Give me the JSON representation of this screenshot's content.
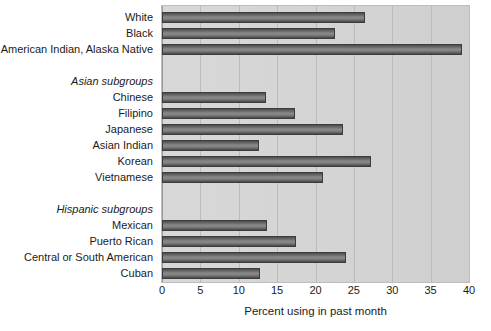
{
  "chart_data": {
    "type": "bar",
    "orientation": "horizontal",
    "title": "",
    "xlabel": "Percent using in past month",
    "ylabel": "",
    "xlim": [
      0,
      40
    ],
    "xticks": [
      0,
      5,
      10,
      15,
      20,
      25,
      30,
      35,
      40
    ],
    "xtick_labels": [
      "0",
      "5",
      "10",
      "15",
      "20",
      "25",
      "30",
      "35",
      "40"
    ],
    "grid": true,
    "grid_axis": "x",
    "legend": "none",
    "bar_color": "#7a7a7a",
    "bar_edge_color": "#3c3c3c",
    "plot_background": "#d4d4d4",
    "rows": [
      {
        "label": "White",
        "value": 26.5,
        "kind": "bar"
      },
      {
        "label": "Black",
        "value": 22.5,
        "kind": "bar"
      },
      {
        "label": "American Indian, Alaska Native",
        "value": 39.1,
        "kind": "bar"
      },
      {
        "label": "",
        "value": null,
        "kind": "spacer"
      },
      {
        "label": "Asian subgroups",
        "value": null,
        "kind": "group"
      },
      {
        "label": "Chinese",
        "value": 13.5,
        "kind": "bar"
      },
      {
        "label": "Filipino",
        "value": 17.3,
        "kind": "bar"
      },
      {
        "label": "Japanese",
        "value": 23.6,
        "kind": "bar"
      },
      {
        "label": "Asian Indian",
        "value": 12.6,
        "kind": "bar"
      },
      {
        "label": "Korean",
        "value": 27.2,
        "kind": "bar"
      },
      {
        "label": "Vietnamese",
        "value": 21.0,
        "kind": "bar"
      },
      {
        "label": "",
        "value": null,
        "kind": "spacer"
      },
      {
        "label": "Hispanic subgroups",
        "value": null,
        "kind": "group"
      },
      {
        "label": "Mexican",
        "value": 13.7,
        "kind": "bar"
      },
      {
        "label": "Puerto Rican",
        "value": 17.5,
        "kind": "bar"
      },
      {
        "label": "Central or South American",
        "value": 24.0,
        "kind": "bar"
      },
      {
        "label": "Cuban",
        "value": 12.8,
        "kind": "bar"
      }
    ],
    "categories": [
      "White",
      "Black",
      "American Indian, Alaska Native",
      "Chinese",
      "Filipino",
      "Japanese",
      "Asian Indian",
      "Korean",
      "Vietnamese",
      "Mexican",
      "Puerto Rican",
      "Central or South American",
      "Cuban"
    ],
    "values": [
      26.5,
      22.5,
      39.1,
      13.5,
      17.3,
      23.6,
      12.6,
      27.2,
      21.0,
      13.7,
      17.5,
      24.0,
      12.8
    ]
  }
}
